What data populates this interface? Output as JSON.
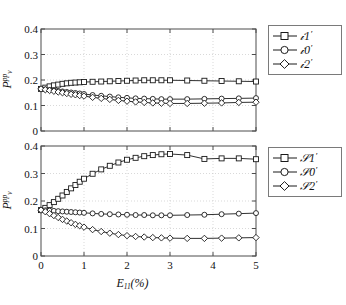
{
  "figure": {
    "background_color": "#ffffff",
    "axis_color": "#4d4d4d",
    "grid_color": "#c8c8c8",
    "line_color": "#1a1a1a"
  },
  "axes": {
    "xlabel_base": "E",
    "xlabel_sub": "11",
    "xlabel_unit": "(%)",
    "ylabel_base": "P",
    "ylabel_sup": "pp",
    "ylabel_sub": "v"
  },
  "chart_data": [
    {
      "type": "line",
      "panel": "top",
      "title": "",
      "xlabel": "E11(%)",
      "ylabel": "Pvpp",
      "xlim": [
        0,
        5
      ],
      "ylim": [
        0,
        0.4
      ],
      "xticks": [
        "0",
        "1",
        "2",
        "3",
        "4",
        "5"
      ],
      "xtick_values": [
        0,
        1,
        2,
        3,
        4,
        5
      ],
      "yticks": [
        "0",
        "0.1",
        "0.2",
        "0.3",
        "0.4"
      ],
      "ytick_values": [
        0,
        0.1,
        0.2,
        0.3,
        0.4
      ],
      "grid": true,
      "legend_position": "outside right top",
      "series": [
        {
          "name": "W1'",
          "marker": "square",
          "x": [
            0,
            0.1,
            0.2,
            0.3,
            0.4,
            0.5,
            0.6,
            0.7,
            0.8,
            0.9,
            1.0,
            1.2,
            1.4,
            1.6,
            1.8,
            2.0,
            2.2,
            2.4,
            2.6,
            2.8,
            3.0,
            3.4,
            3.8,
            4.2,
            4.6,
            5.0
          ],
          "values": [
            0.165,
            0.17,
            0.175,
            0.179,
            0.182,
            0.185,
            0.187,
            0.189,
            0.19,
            0.191,
            0.192,
            0.193,
            0.194,
            0.195,
            0.196,
            0.197,
            0.198,
            0.199,
            0.199,
            0.199,
            0.199,
            0.198,
            0.197,
            0.196,
            0.195,
            0.194
          ]
        },
        {
          "name": "W0'",
          "marker": "circle",
          "x": [
            0,
            0.1,
            0.2,
            0.3,
            0.4,
            0.5,
            0.6,
            0.7,
            0.8,
            0.9,
            1.0,
            1.2,
            1.4,
            1.6,
            1.8,
            2.0,
            2.2,
            2.4,
            2.6,
            2.8,
            3.0,
            3.4,
            3.8,
            4.2,
            4.6,
            5.0
          ],
          "values": [
            0.165,
            0.163,
            0.161,
            0.159,
            0.157,
            0.155,
            0.153,
            0.151,
            0.149,
            0.147,
            0.145,
            0.141,
            0.138,
            0.135,
            0.132,
            0.13,
            0.128,
            0.127,
            0.126,
            0.125,
            0.125,
            0.125,
            0.126,
            0.127,
            0.128,
            0.129
          ]
        },
        {
          "name": "W2'",
          "marker": "diamond",
          "x": [
            0,
            0.1,
            0.2,
            0.3,
            0.4,
            0.5,
            0.6,
            0.7,
            0.8,
            0.9,
            1.0,
            1.2,
            1.4,
            1.6,
            1.8,
            2.0,
            2.2,
            2.4,
            2.6,
            2.8,
            3.0,
            3.4,
            3.8,
            4.2,
            4.6,
            5.0
          ],
          "values": [
            0.165,
            0.162,
            0.159,
            0.156,
            0.153,
            0.15,
            0.147,
            0.144,
            0.142,
            0.139,
            0.137,
            0.132,
            0.128,
            0.124,
            0.12,
            0.117,
            0.114,
            0.112,
            0.11,
            0.109,
            0.108,
            0.108,
            0.109,
            0.11,
            0.112,
            0.113
          ]
        }
      ]
    },
    {
      "type": "line",
      "panel": "bottom",
      "title": "",
      "xlabel": "E11(%)",
      "ylabel": "Pvpp",
      "xlim": [
        0,
        5
      ],
      "ylim": [
        0,
        0.4
      ],
      "xticks": [
        "0",
        "1",
        "2",
        "3",
        "4",
        "5"
      ],
      "xtick_values": [
        0,
        1,
        2,
        3,
        4,
        5
      ],
      "yticks": [
        "0",
        "0.1",
        "0.2",
        "0.3",
        "0.4"
      ],
      "ytick_values": [
        0,
        0.1,
        0.2,
        0.3,
        0.4
      ],
      "grid": true,
      "legend_position": "outside right top",
      "series": [
        {
          "name": "S1'",
          "marker": "square",
          "x": [
            0,
            0.1,
            0.2,
            0.3,
            0.4,
            0.5,
            0.6,
            0.7,
            0.8,
            0.9,
            1.0,
            1.2,
            1.4,
            1.6,
            1.8,
            2.0,
            2.2,
            2.4,
            2.6,
            2.8,
            3.0,
            3.4,
            3.8,
            4.2,
            4.6,
            5.0
          ],
          "values": [
            0.167,
            0.175,
            0.185,
            0.196,
            0.208,
            0.22,
            0.233,
            0.246,
            0.258,
            0.27,
            0.281,
            0.299,
            0.315,
            0.328,
            0.34,
            0.35,
            0.357,
            0.363,
            0.367,
            0.37,
            0.371,
            0.367,
            0.353,
            0.355,
            0.355,
            0.352
          ]
        },
        {
          "name": "S0'",
          "marker": "circle",
          "x": [
            0,
            0.1,
            0.2,
            0.3,
            0.4,
            0.5,
            0.6,
            0.7,
            0.8,
            0.9,
            1.0,
            1.2,
            1.4,
            1.6,
            1.8,
            2.0,
            2.2,
            2.4,
            2.6,
            2.8,
            3.0,
            3.4,
            3.8,
            4.2,
            4.6,
            5.0
          ],
          "values": [
            0.167,
            0.166,
            0.165,
            0.164,
            0.163,
            0.162,
            0.161,
            0.16,
            0.159,
            0.158,
            0.157,
            0.155,
            0.153,
            0.152,
            0.151,
            0.15,
            0.149,
            0.149,
            0.148,
            0.148,
            0.148,
            0.149,
            0.15,
            0.152,
            0.154,
            0.156
          ]
        },
        {
          "name": "S2'",
          "marker": "diamond",
          "x": [
            0,
            0.1,
            0.2,
            0.3,
            0.4,
            0.5,
            0.6,
            0.7,
            0.8,
            0.9,
            1.0,
            1.2,
            1.4,
            1.6,
            1.8,
            2.0,
            2.2,
            2.4,
            2.6,
            2.8,
            3.0,
            3.4,
            3.8,
            4.2,
            4.6,
            5.0
          ],
          "values": [
            0.167,
            0.161,
            0.154,
            0.147,
            0.14,
            0.133,
            0.127,
            0.121,
            0.115,
            0.11,
            0.105,
            0.096,
            0.089,
            0.083,
            0.078,
            0.074,
            0.071,
            0.069,
            0.067,
            0.066,
            0.065,
            0.064,
            0.064,
            0.065,
            0.066,
            0.067
          ]
        }
      ]
    }
  ]
}
